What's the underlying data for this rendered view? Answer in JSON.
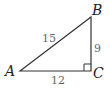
{
  "diagram": {
    "type": "right-triangle",
    "vertices": {
      "A": {
        "label": "A"
      },
      "B": {
        "label": "B"
      },
      "C": {
        "label": "C"
      }
    },
    "sides": {
      "AB": {
        "label": "15"
      },
      "BC": {
        "label": "9"
      },
      "AC": {
        "label": "12"
      }
    },
    "right_angle_at": "C",
    "colors": {
      "stroke": "#333333",
      "length_label": "#666666",
      "vertex_label": "#222222"
    }
  }
}
